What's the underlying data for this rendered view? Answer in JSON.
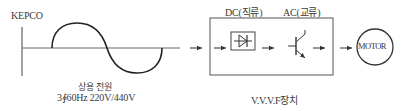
{
  "source": {
    "label": "KEPCO",
    "caption_line1": "상용 전원",
    "caption_line2": "3∮60Hz 220V/440V"
  },
  "vvvf": {
    "dc_label": "DC(직류)",
    "ac_label": "AC(교류)",
    "caption": "V.V.V.F장치",
    "rectifier_icon": "diode-icon",
    "inverter_icon": "transistor-icon"
  },
  "motor": {
    "label": "MOTOR"
  },
  "colors": {
    "line": "#333333",
    "box": "#555555",
    "text": "#3a3a3a",
    "background": "#ffffff"
  }
}
